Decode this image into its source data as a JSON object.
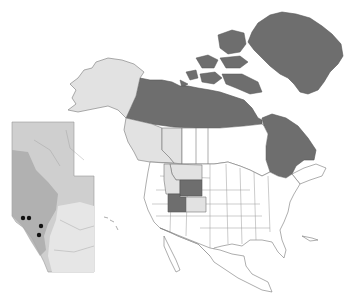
{
  "map": {
    "type": "distribution-map",
    "colors": {
      "background": "#ffffff",
      "present": "#6e6e6e",
      "adjacent": "#e2e2e2",
      "absent": "#ffffff",
      "border": "#7a7a7a",
      "inset_land": "#cfcfcf",
      "inset_mountain": "#a9a9a9",
      "inset_plain": "#e6e6e6",
      "point": "#111111"
    },
    "regions_present": [
      "Greenland",
      "Nunavut",
      "Northwest Territories",
      "Yukon",
      "Quebec",
      "Wyoming",
      "Utah"
    ],
    "regions_adjacent": [
      "Alaska",
      "British Columbia",
      "Alberta",
      "Montana",
      "Idaho",
      "Colorado"
    ],
    "inset": {
      "region": "Alberta",
      "points": [
        {
          "x": 23,
          "y": 218
        },
        {
          "x": 29,
          "y": 218
        },
        {
          "x": 41,
          "y": 226
        },
        {
          "x": 39,
          "y": 235
        }
      ]
    }
  }
}
